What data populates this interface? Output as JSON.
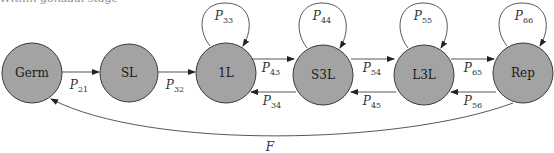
{
  "caption_fragment": "Within gonadal stage",
  "colors": {
    "node_fill": "#a3a3a3",
    "node_stroke": "#3a3a3a",
    "edge": "#444444"
  },
  "nodes": [
    {
      "id": "germ",
      "label": "Germ",
      "cx": 32,
      "cy": 73
    },
    {
      "id": "sl",
      "label": "SL",
      "cx": 129,
      "cy": 73
    },
    {
      "id": "1l",
      "label": "1L",
      "cx": 226,
      "cy": 73
    },
    {
      "id": "s3l",
      "label": "S3L",
      "cx": 323,
      "cy": 75
    },
    {
      "id": "l3l",
      "label": "L3L",
      "cx": 424,
      "cy": 75
    },
    {
      "id": "rep",
      "label": "Rep",
      "cx": 523,
      "cy": 73
    }
  ],
  "edges": {
    "p21": {
      "P": "P",
      "sub": "21"
    },
    "p32": {
      "P": "P",
      "sub": "32"
    },
    "p33": {
      "P": "P",
      "sub": "33"
    },
    "p43": {
      "P": "P",
      "sub": "43"
    },
    "p34": {
      "P": "P",
      "sub": "34"
    },
    "p44": {
      "P": "P",
      "sub": "44"
    },
    "p54": {
      "P": "P",
      "sub": "54"
    },
    "p45": {
      "P": "P",
      "sub": "45"
    },
    "p55": {
      "P": "P",
      "sub": "55"
    },
    "p65": {
      "P": "P",
      "sub": "65"
    },
    "p56": {
      "P": "P",
      "sub": "56"
    },
    "p66": {
      "P": "P",
      "sub": "66"
    },
    "f": {
      "label": "F"
    }
  }
}
